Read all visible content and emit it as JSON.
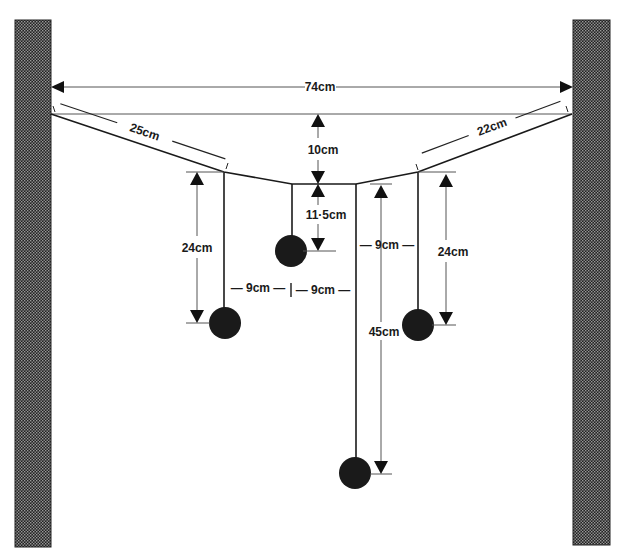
{
  "diagram": {
    "type": "hanging-mobile-dimension-drawing",
    "colors": {
      "ink": "#1a1a1a",
      "wall": "#2a2a2a",
      "dimension": "#555555",
      "background": "#ffffff"
    },
    "labels": {
      "span": "74cm",
      "left_segment": "25cm",
      "right_segment": "22cm",
      "sag": "10cm",
      "middle_drop": "11·5cm",
      "left_drop": "24cm",
      "right_drop": "24cm",
      "long_drop": "45cm",
      "left_spacing": "— 9cm —",
      "mid_spacing": "— 9cm —",
      "right_spacing": "— 9cm —"
    },
    "walls": [
      {
        "name": "left-wall"
      },
      {
        "name": "right-wall"
      }
    ],
    "weights": [
      {
        "name": "left-weight"
      },
      {
        "name": "middle-weight"
      },
      {
        "name": "right-weight"
      },
      {
        "name": "bottom-weight"
      }
    ]
  }
}
